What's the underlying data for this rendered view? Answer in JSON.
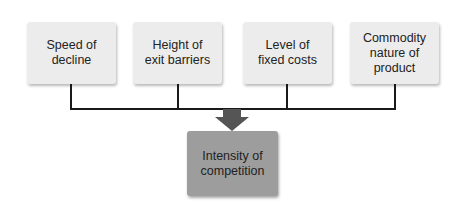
{
  "diagram": {
    "factors": [
      {
        "label": "Speed of\ndecline"
      },
      {
        "label": "Height of\nexit barriers"
      },
      {
        "label": "Level of\nfixed costs"
      },
      {
        "label": "Commodity\nnature of\nproduct"
      }
    ],
    "result": {
      "label": "Intensity of\ncompetition"
    },
    "colors": {
      "factor_box": "#ececec",
      "result_box": "#9d9d9d",
      "arrow": "#555555",
      "connector": "#1a1a1a"
    }
  }
}
